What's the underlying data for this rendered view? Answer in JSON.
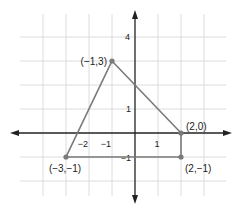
{
  "diagram": {
    "type": "coordinate-plane-polygon",
    "grid": {
      "x_range": [
        -4,
        3
      ],
      "y_range": [
        -2,
        4
      ],
      "step": 1,
      "color": "#dcdcdc"
    },
    "axes": {
      "color": "#222222",
      "x_tick_labels": [
        {
          "value": -2,
          "text": "−2"
        },
        {
          "value": -1,
          "text": "−1"
        },
        {
          "value": 1,
          "text": "1"
        }
      ],
      "y_tick_labels": [
        {
          "value": 4,
          "text": "4"
        },
        {
          "value": 1,
          "text": "1"
        },
        {
          "value": -1,
          "text": "−1"
        }
      ]
    },
    "polygon": {
      "stroke_color": "#7a7a7a",
      "vertices": [
        {
          "x": -1,
          "y": 3,
          "label": "(−1,3)"
        },
        {
          "x": 2,
          "y": 0,
          "label": "(2,0)"
        },
        {
          "x": 2,
          "y": -1,
          "label": "(2,−1)"
        },
        {
          "x": -3,
          "y": -1,
          "label": "(−3,−1)"
        }
      ]
    }
  }
}
